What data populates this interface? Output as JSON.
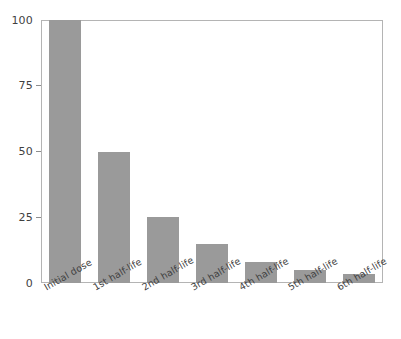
{
  "chart_data": {
    "type": "bar",
    "title": "",
    "subtitle": "",
    "xlabel": "",
    "ylabel": "",
    "categories": [
      "Initial dose",
      "1st half-life",
      "2nd half-life",
      "3rd half-life",
      "4th half-life",
      "5th half-life",
      "6th half-life"
    ],
    "values": [
      100,
      50,
      25,
      15,
      8,
      5,
      3.5
    ],
    "ylim": [
      0,
      100
    ],
    "yticks": [
      0,
      25,
      50,
      75,
      100
    ],
    "ytick_labels": [
      "0",
      "25",
      "50",
      "75",
      "100"
    ],
    "grid": false,
    "legend": false,
    "bar_color": "#9a9a9a",
    "frame_color": "#b4b4b4",
    "background_color": "#ffffff",
    "text_color": "#3f3f3f",
    "xtick_label_rotation": -30
  }
}
